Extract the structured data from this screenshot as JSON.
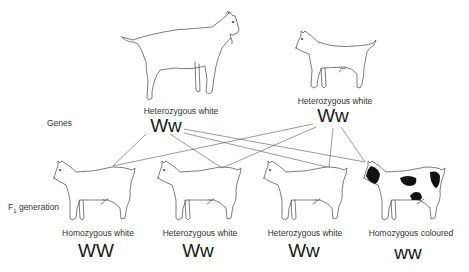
{
  "side_labels": {
    "genes": "Genes",
    "f1_prefix": "F",
    "f1_subscript": "1",
    "f1_suffix": " generation"
  },
  "parents": [
    {
      "phenotype": "Heterozygous white",
      "genotype": "Ww",
      "coat": "white"
    },
    {
      "phenotype": "Heterozygous white",
      "genotype": "Ww",
      "coat": "white"
    }
  ],
  "offspring": [
    {
      "phenotype": "Homozygous white",
      "genotype": "WW",
      "coat": "white"
    },
    {
      "phenotype": "Heterozygous white",
      "genotype": "Ww",
      "coat": "white"
    },
    {
      "phenotype": "Heterozygous white",
      "genotype": "Ww",
      "coat": "white"
    },
    {
      "phenotype": "Homozygous coloured",
      "genotype": "ww",
      "coat": "black-and-white"
    }
  ],
  "colors": {
    "line": "#555555",
    "outline": "#444444",
    "patch": "#111111",
    "background": "#ffffff"
  }
}
